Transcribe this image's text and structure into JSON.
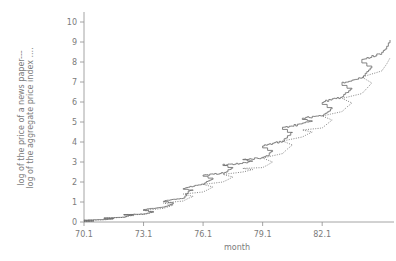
{
  "chart_data": {
    "type": "line",
    "title": "",
    "subtitle": "",
    "xlabel": "month",
    "ylabel_line1": "log of the price of a news paper---",
    "ylabel_line2": "log of the aggregate price index ....",
    "xlim": [
      70.1,
      85.6
    ],
    "ylim": [
      0,
      10.4
    ],
    "xticks": [
      "70.1",
      "73.1",
      "76.1",
      "79.1",
      "82.1"
    ],
    "xtick_values": [
      70.1,
      73.1,
      76.1,
      79.1,
      82.1
    ],
    "yticks": [
      "0",
      "1",
      "2",
      "3",
      "4",
      "5",
      "6",
      "7",
      "8",
      "9",
      "10"
    ],
    "ytick_values": [
      0,
      1,
      2,
      3,
      4,
      5,
      6,
      7,
      8,
      9,
      10
    ],
    "grid": false,
    "legend_position": "none",
    "legend_note": "series identified by line style in the y-axis title",
    "series": [
      {
        "name": "log of the price of a news paper",
        "style": "solid-step",
        "color": "#6e6e6e",
        "x": [
          70.1,
          70.4,
          70.7,
          70.1,
          71.1,
          71.4,
          71.7,
          71.1,
          72.1,
          72.4,
          72.7,
          72.1,
          73.1,
          73.4,
          73.7,
          73.1,
          74.1,
          74.4,
          74.7,
          74.1,
          75.1,
          75.4,
          75.7,
          75.1,
          76.1,
          76.4,
          76.7,
          76.1,
          77.1,
          77.4,
          77.7,
          77.1,
          78.1,
          78.4,
          78.7,
          78.1,
          79.1,
          79.4,
          79.7,
          79.1,
          80.1,
          80.4,
          80.7,
          80.1,
          81.1,
          81.4,
          81.7,
          81.1,
          82.1,
          82.4,
          82.7,
          82.1,
          83.1,
          83.4,
          83.7,
          83.1,
          84.1,
          84.4,
          84.7,
          84.1,
          85.1,
          85.4,
          85.6
        ],
        "values": [
          0.02,
          0.04,
          0.06,
          0.09,
          0.12,
          0.14,
          0.17,
          0.2,
          0.24,
          0.33,
          0.35,
          0.37,
          0.4,
          0.45,
          0.52,
          0.62,
          0.75,
          0.82,
          0.95,
          1.05,
          1.2,
          1.55,
          1.6,
          1.68,
          1.9,
          2.05,
          2.2,
          2.32,
          2.45,
          2.58,
          2.72,
          2.85,
          2.95,
          3.0,
          3.05,
          3.12,
          3.2,
          3.35,
          3.55,
          3.8,
          4.05,
          4.3,
          4.5,
          4.72,
          4.9,
          5.0,
          5.08,
          5.2,
          5.3,
          5.5,
          5.75,
          6.0,
          6.25,
          6.5,
          6.72,
          6.95,
          7.2,
          7.5,
          7.8,
          8.1,
          8.45,
          8.8,
          9.1
        ]
      },
      {
        "name": "log of the aggregate price index",
        "style": "dotted",
        "color": "#6e6e6e",
        "x": [
          70.1,
          70.4,
          70.7,
          70.1,
          71.1,
          71.4,
          71.7,
          71.1,
          72.1,
          72.4,
          72.7,
          72.1,
          73.1,
          73.4,
          73.7,
          73.1,
          74.1,
          74.4,
          74.7,
          74.1,
          75.1,
          75.4,
          75.7,
          75.1,
          76.1,
          76.4,
          76.7,
          76.1,
          77.1,
          77.4,
          77.7,
          77.1,
          78.1,
          78.4,
          78.7,
          78.1,
          79.1,
          79.4,
          79.7,
          79.1,
          80.1,
          80.4,
          80.7,
          80.1,
          81.1,
          81.4,
          81.7,
          81.1,
          82.1,
          82.4,
          82.7,
          82.1,
          83.1,
          83.4,
          83.7,
          83.1,
          84.1,
          84.4,
          84.7,
          84.1,
          85.1,
          85.4,
          85.6
        ],
        "values": [
          0.02,
          0.04,
          0.06,
          0.08,
          0.11,
          0.13,
          0.16,
          0.19,
          0.23,
          0.3,
          0.32,
          0.35,
          0.38,
          0.43,
          0.5,
          0.58,
          0.68,
          0.76,
          0.85,
          0.95,
          1.05,
          1.18,
          1.28,
          1.4,
          1.5,
          1.62,
          1.75,
          1.88,
          2.0,
          2.12,
          2.25,
          2.38,
          2.5,
          2.56,
          2.62,
          2.68,
          2.72,
          2.85,
          3.0,
          3.2,
          3.42,
          3.65,
          3.85,
          4.05,
          4.25,
          4.38,
          4.5,
          4.6,
          4.7,
          4.9,
          5.1,
          5.3,
          5.52,
          5.75,
          5.95,
          6.18,
          6.42,
          6.68,
          6.95,
          7.25,
          7.55,
          7.9,
          8.2
        ]
      }
    ]
  }
}
